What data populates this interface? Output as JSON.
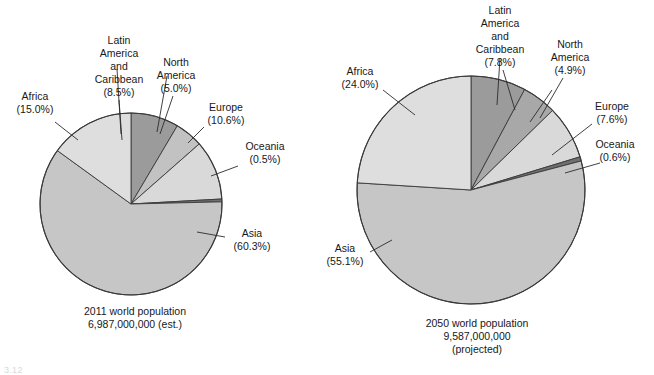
{
  "figure": {
    "title": "",
    "footnote": "3.12"
  },
  "chart_data": [
    {
      "type": "pie",
      "title": "2011 world population",
      "subtitle": "6,987,000,000 (est.)",
      "caption_lines": [
        "2011 world population",
        "6,987,000,000 (est.)"
      ],
      "categories": [
        "Latin America and Caribbean",
        "North America",
        "Europe",
        "Oceania",
        "Asia",
        "Africa"
      ],
      "values": [
        8.5,
        5.0,
        10.6,
        0.5,
        60.3,
        15.0
      ],
      "unit": "percent",
      "total_population": "6,987,000,000",
      "year": "2011",
      "legend": "labels-outside-with-leader-lines",
      "slices": [
        {
          "label_lines": [
            "Latin",
            "America",
            "and",
            "Caribbean"
          ],
          "percent_text": "(8.5%)",
          "value": 8.5,
          "color": "#9b9b9b"
        },
        {
          "label_lines": [
            "North",
            "America"
          ],
          "percent_text": "(5.0%)",
          "value": 5.0,
          "color": "#c2c2c2"
        },
        {
          "label_lines": [
            "Europe"
          ],
          "percent_text": "(10.6%)",
          "value": 10.6,
          "color": "#d9d9d9"
        },
        {
          "label_lines": [
            "Oceania"
          ],
          "percent_text": "(0.5%)",
          "value": 0.5,
          "color": "#6f6f6f"
        },
        {
          "label_lines": [
            "Asia"
          ],
          "percent_text": "(60.3%)",
          "value": 60.3,
          "color": "#c6c6c6"
        },
        {
          "label_lines": [
            "Africa"
          ],
          "percent_text": "(15.0%)",
          "value": 15.0,
          "color": "#dedede"
        }
      ]
    },
    {
      "type": "pie",
      "title": "2050 world population",
      "subtitle": "9,587,000,000 (projected)",
      "caption_lines": [
        "2050 world population",
        "9,587,000,000",
        "(projected)"
      ],
      "categories": [
        "Latin America and Caribbean",
        "North America",
        "Europe",
        "Oceania",
        "Asia",
        "Africa"
      ],
      "values": [
        7.8,
        4.9,
        7.6,
        0.6,
        55.1,
        24.0
      ],
      "unit": "percent",
      "total_population": "9,587,000,000",
      "year": "2050",
      "legend": "labels-outside-with-leader-lines",
      "slices": [
        {
          "label_lines": [
            "Latin",
            "America",
            "and",
            "Caribbean"
          ],
          "percent_text": "(7.8%)",
          "value": 7.8,
          "color": "#9b9b9b"
        },
        {
          "label_lines": [
            "North",
            "America"
          ],
          "percent_text": "(4.9%)",
          "value": 4.9,
          "color": "#a8a8a8"
        },
        {
          "label_lines": [
            "Europe"
          ],
          "percent_text": "(7.6%)",
          "value": 7.6,
          "color": "#d9d9d9"
        },
        {
          "label_lines": [
            "Oceania"
          ],
          "percent_text": "(0.6%)",
          "value": 0.6,
          "color": "#6f6f6f"
        },
        {
          "label_lines": [
            "Asia"
          ],
          "percent_text": "(55.1%)",
          "value": 55.1,
          "color": "#c6c6c6"
        },
        {
          "label_lines": [
            "Africa"
          ],
          "percent_text": "(24.0%)",
          "value": 24.0,
          "color": "#dedede"
        }
      ]
    }
  ],
  "left_chart": {
    "africa": {
      "l1": "Africa",
      "l2": "(15.0%)"
    },
    "latin": {
      "l1": "Latin",
      "l2": "America",
      "l3": "and",
      "l4": "Caribbean",
      "l5": "(8.5%)"
    },
    "north": {
      "l1": "North",
      "l2": "America",
      "l3": "(5.0%)"
    },
    "europe": {
      "l1": "Europe",
      "l2": "(10.6%)"
    },
    "oceania": {
      "l1": "Oceania",
      "l2": "(0.5%)"
    },
    "asia": {
      "l1": "Asia",
      "l2": "(60.3%)"
    },
    "caption": {
      "l1": "2011 world population",
      "l2": "6,987,000,000 (est.)"
    }
  },
  "right_chart": {
    "africa": {
      "l1": "Africa",
      "l2": "(24.0%)"
    },
    "latin": {
      "l1": "Latin",
      "l2": "America",
      "l3": "and",
      "l4": "Caribbean",
      "l5": "(7.8%)"
    },
    "north": {
      "l1": "North",
      "l2": "America",
      "l3": "(4.9%)"
    },
    "europe": {
      "l1": "Europe",
      "l2": "(7.6%)"
    },
    "oceania": {
      "l1": "Oceania",
      "l2": "(0.6%)"
    },
    "asia": {
      "l1": "Asia",
      "l2": "(55.1%)"
    },
    "caption": {
      "l1": "2050 world population",
      "l2": "9,587,000,000",
      "l3": "(projected)"
    }
  }
}
